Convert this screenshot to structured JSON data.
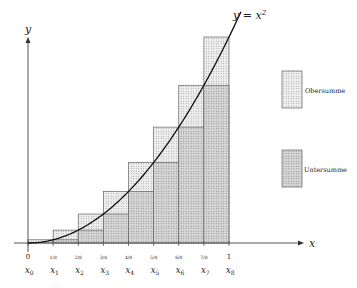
{
  "function_label": "y = x²",
  "function_label_parts": {
    "lhs": "y = x",
    "exp": "2"
  },
  "axes": {
    "x_label": "x",
    "y_label": "y"
  },
  "n": 8,
  "ticks_top": [
    "0",
    "1/8",
    "2/8",
    "3/8",
    "4/8",
    "5/8",
    "6/8",
    "7/8",
    "1"
  ],
  "ticks_bottom": [
    "x0",
    "x1",
    "x2",
    "x3",
    "x4",
    "x5",
    "x6",
    "x7",
    "x8"
  ],
  "legend": [
    {
      "label": "Obersumme",
      "fill": "#ececec"
    },
    {
      "label": "Untersumme",
      "fill": "#d4d4d4"
    }
  ],
  "colors": {
    "upper_fill": "#ececec",
    "lower_fill": "#d2d2d2",
    "stroke": "#555555",
    "curve": "#111111"
  },
  "chart_data": {
    "type": "bar",
    "title": "",
    "function": "y = x^2",
    "interval": [
      0,
      1
    ],
    "categories": [
      "[x0,x1]",
      "[x1,x2]",
      "[x2,x3]",
      "[x3,x4]",
      "[x4,x5]",
      "[x5,x6]",
      "[x6,x7]",
      "[x7,x8]"
    ],
    "series": [
      {
        "name": "Obersumme",
        "values": [
          0.015625,
          0.0625,
          0.140625,
          0.25,
          0.390625,
          0.5625,
          0.765625,
          1.0
        ]
      },
      {
        "name": "Untersumme",
        "values": [
          0.0,
          0.015625,
          0.0625,
          0.140625,
          0.25,
          0.390625,
          0.5625,
          0.765625
        ]
      }
    ],
    "xlabel": "x",
    "ylabel": "y",
    "xlim": [
      0,
      1
    ],
    "ylim": [
      0,
      1
    ],
    "grid": false,
    "legend_position": "right"
  }
}
